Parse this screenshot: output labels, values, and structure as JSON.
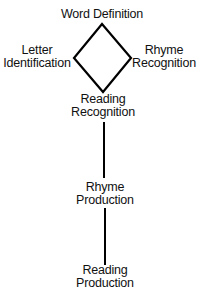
{
  "diagram": {
    "type": "network",
    "nodes": [
      {
        "id": "word_definition",
        "lines": [
          "Word Definition"
        ]
      },
      {
        "id": "letter_identification",
        "lines": [
          "Letter",
          "Identification"
        ]
      },
      {
        "id": "rhyme_recognition",
        "lines": [
          "Rhyme",
          "Recognition"
        ]
      },
      {
        "id": "reading_recognition",
        "lines": [
          "Reading",
          "Recognition"
        ]
      },
      {
        "id": "rhyme_production",
        "lines": [
          "Rhyme",
          "Production"
        ]
      },
      {
        "id": "reading_production",
        "lines": [
          "Reading",
          "Production"
        ]
      }
    ],
    "edges": [
      {
        "from": "word_definition",
        "to": "letter_identification"
      },
      {
        "from": "word_definition",
        "to": "rhyme_recognition"
      },
      {
        "from": "letter_identification",
        "to": "reading_recognition"
      },
      {
        "from": "rhyme_recognition",
        "to": "reading_recognition"
      },
      {
        "from": "reading_recognition",
        "to": "rhyme_production"
      },
      {
        "from": "rhyme_production",
        "to": "reading_production"
      }
    ],
    "line_color": "#000000"
  }
}
